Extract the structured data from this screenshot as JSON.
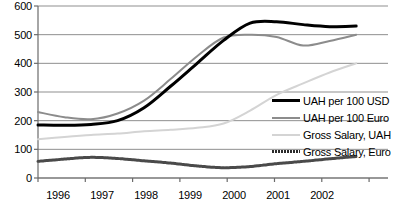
{
  "chart_data": {
    "type": "line",
    "title": "",
    "xlabel": "",
    "ylabel": "",
    "ylim": [
      0,
      600
    ],
    "yticks": [
      0,
      100,
      200,
      300,
      400,
      500,
      600
    ],
    "xticks": [
      "1996",
      "1997",
      "1998",
      "1999",
      "2000",
      "2001",
      "2002"
    ],
    "grid": true,
    "legend_position": "right",
    "x": [
      1996,
      1996.5,
      1997,
      1997.5,
      1998,
      1998.5,
      1999,
      1999.5,
      2000,
      2000.5,
      2001,
      2001.5,
      2002
    ],
    "series": [
      {
        "name": "UAH per 100 USD",
        "color": "#000000",
        "width": 3,
        "values": [
          185,
          184,
          187,
          200,
          245,
          320,
          400,
          480,
          540,
          545,
          535,
          528,
          530
        ]
      },
      {
        "name": "UAH per 100 Euro",
        "color": "#8c8c8c",
        "width": 2,
        "values": [
          230,
          212,
          205,
          225,
          270,
          345,
          425,
          490,
          500,
          492,
          462,
          478,
          500
        ]
      },
      {
        "name": "Gross Salary, UAH",
        "color": "#d4d4d4",
        "width": 2,
        "values": [
          135,
          143,
          150,
          155,
          163,
          168,
          175,
          190,
          235,
          290,
          330,
          368,
          400
        ]
      },
      {
        "name": "Gross Salary, Euro",
        "color": "#4a4a4a",
        "width": 3,
        "values": [
          58,
          66,
          72,
          68,
          60,
          52,
          42,
          36,
          40,
          50,
          58,
          67,
          75
        ]
      }
    ]
  },
  "axis": {
    "ytick_labels": [
      "600",
      "500",
      "400",
      "300",
      "200",
      "100",
      "0"
    ],
    "xtick_labels": [
      "1996",
      "1997",
      "1998",
      "1999",
      "2000",
      "2001",
      "2002"
    ]
  },
  "legend": {
    "items": [
      {
        "label": "UAH per 100 USD",
        "color": "#000000",
        "style": "solid-thick"
      },
      {
        "label": "UAH per 100 Euro",
        "color": "#8c8c8c",
        "style": "solid-medium"
      },
      {
        "label": "Gross Salary, UAH",
        "color": "#d4d4d4",
        "style": "solid-light"
      },
      {
        "label": "Gross Salary, Euro",
        "color": "#4a4a4a",
        "style": "dashed-thick"
      }
    ]
  },
  "colors": {
    "axis": "#6b6b6b",
    "grid": "#8f8f8f",
    "background": "#ffffff"
  }
}
